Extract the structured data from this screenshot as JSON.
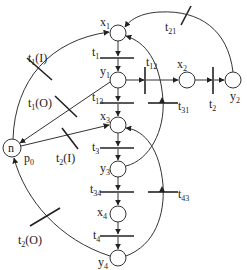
{
  "diagram": {
    "type": "petri-net",
    "colors": {
      "stroke": "#333333",
      "background": "#ffffff",
      "text": "#222222"
    },
    "places": [
      {
        "id": "x1",
        "label": "x",
        "sub": "1"
      },
      {
        "id": "y1",
        "label": "y",
        "sub": "1"
      },
      {
        "id": "x3",
        "label": "x",
        "sub": "3"
      },
      {
        "id": "y3",
        "label": "y",
        "sub": "3"
      },
      {
        "id": "x4",
        "label": "x",
        "sub": "4"
      },
      {
        "id": "y4",
        "label": "y",
        "sub": "4"
      },
      {
        "id": "x2",
        "label": "x",
        "sub": "2"
      },
      {
        "id": "y2",
        "label": "y",
        "sub": "2"
      },
      {
        "id": "p0",
        "label": "p",
        "sub": "0",
        "token": "n"
      }
    ],
    "transitions": [
      {
        "id": "t1",
        "label": "t",
        "sub": "1"
      },
      {
        "id": "t13",
        "label": "t",
        "sub": "13"
      },
      {
        "id": "t3",
        "label": "t",
        "sub": "3"
      },
      {
        "id": "t34",
        "label": "t",
        "sub": "34"
      },
      {
        "id": "t4",
        "label": "t",
        "sub": "4"
      },
      {
        "id": "t12",
        "label": "t",
        "sub": "12"
      },
      {
        "id": "t2",
        "label": "t",
        "sub": "2"
      },
      {
        "id": "t31",
        "label": "t",
        "sub": "31"
      },
      {
        "id": "t43",
        "label": "t",
        "sub": "43"
      },
      {
        "id": "t21",
        "label": "t",
        "sub": "21"
      },
      {
        "id": "t1I",
        "label": "t",
        "sub": "1",
        "suffix": "(I)"
      },
      {
        "id": "t1O",
        "label": "t",
        "sub": "1",
        "suffix": "(O)"
      },
      {
        "id": "t2I",
        "label": "t",
        "sub": "2",
        "suffix": "(I)"
      },
      {
        "id": "t2O",
        "label": "t",
        "sub": "2",
        "suffix": "(O)"
      }
    ]
  }
}
